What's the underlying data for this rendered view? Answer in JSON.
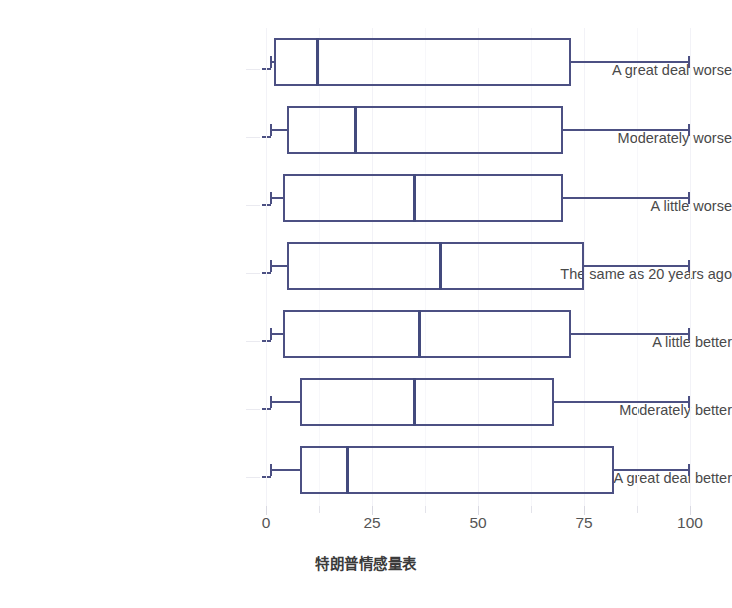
{
  "chart_data": {
    "type": "box",
    "title": "",
    "xlabel": "特朗普情感量表",
    "ylabel": "",
    "xlim": [
      0,
      100
    ],
    "xticks": [
      0,
      25,
      50,
      75,
      100
    ],
    "xticklabels": [
      "0",
      "25",
      "50",
      "75",
      "100"
    ],
    "grid": "vertical-faint",
    "legend": "none",
    "orientation": "horizontal",
    "line_color": "#4c5083",
    "median_color": "#434a7d",
    "box_fill": "none",
    "categories": [
      "A great deal worse",
      "Moderately worse",
      "A little worse",
      "The same as 20 years ago",
      "A little better",
      "Moderately better",
      "A great deal better"
    ],
    "boxes": [
      {
        "category": "A great deal worse",
        "whisker_low": 1,
        "q1": 2,
        "median": 12,
        "q3": 72,
        "whisker_high": 100
      },
      {
        "category": "Moderately worse",
        "whisker_low": 1,
        "q1": 5,
        "median": 21,
        "q3": 70,
        "whisker_high": 100
      },
      {
        "category": "A little worse",
        "whisker_low": 1,
        "q1": 4,
        "median": 35,
        "q3": 70,
        "whisker_high": 100
      },
      {
        "category": "The same as 20 years ago",
        "whisker_low": 1,
        "q1": 5,
        "median": 41,
        "q3": 75,
        "whisker_high": 100
      },
      {
        "category": "A little better",
        "whisker_low": 1,
        "q1": 4,
        "median": 36,
        "q3": 72,
        "whisker_high": 100
      },
      {
        "category": "Moderately better",
        "whisker_low": 1,
        "q1": 8,
        "median": 35,
        "q3": 68,
        "whisker_high": 100
      },
      {
        "category": "A great deal better",
        "whisker_low": 1,
        "q1": 8,
        "median": 19,
        "q3": 82,
        "whisker_high": 100
      }
    ]
  },
  "axis": {
    "x_title": "特朗普情感量表",
    "tick_labels": [
      "0",
      "25",
      "50",
      "75",
      "100"
    ]
  },
  "labels": {
    "row_0": "A great deal worse",
    "row_1": "Moderately worse",
    "row_2": "A little worse",
    "row_3": "The same as 20 years ago",
    "row_4": "A little better",
    "row_5": "Moderately better",
    "row_6": "A great deal better"
  }
}
